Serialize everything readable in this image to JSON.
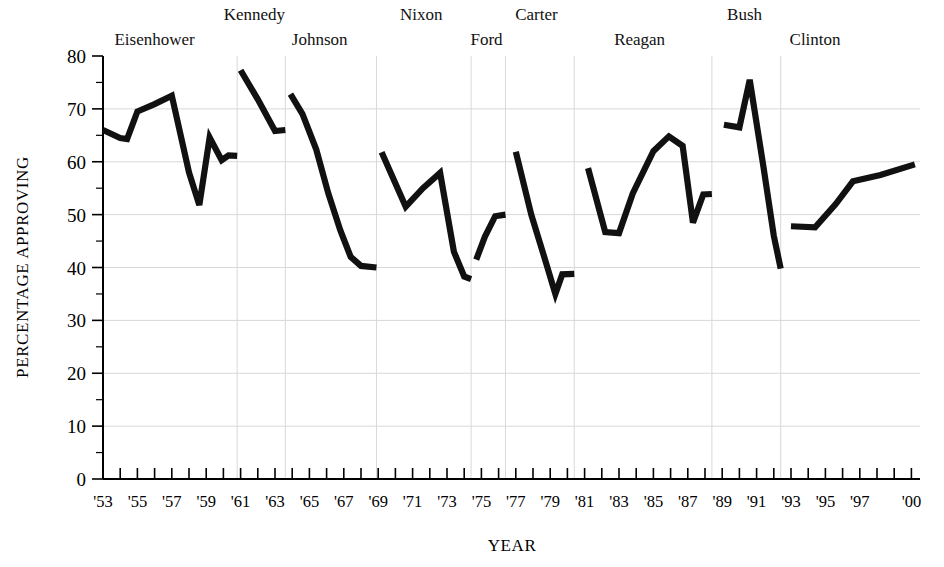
{
  "chart_data": {
    "type": "line",
    "title": "",
    "xlabel": "YEAR",
    "ylabel": "PERCENTAGE APPROVING",
    "ylim": [
      0,
      80
    ],
    "ytick_values": [
      0,
      10,
      20,
      30,
      40,
      50,
      60,
      70,
      80
    ],
    "ytick_labels": [
      "0",
      "10",
      "20",
      "30",
      "40",
      "50",
      "60",
      "70",
      "80"
    ],
    "y_minor_step": 5,
    "xlim": [
      1953,
      2000.5
    ],
    "xtick_labels": [
      "'53",
      "'55",
      "'57",
      "'59",
      "'61",
      "'63",
      "'65",
      "'67",
      "'69",
      "'71",
      "'73",
      "'75",
      "'77",
      "'79",
      "'81",
      "'83",
      "'85",
      "'87",
      "'89",
      "'91",
      "'93",
      "'95",
      "'97",
      "'00"
    ],
    "xtick_values": [
      1953,
      1955,
      1957,
      1959,
      1961,
      1963,
      1965,
      1967,
      1969,
      1971,
      1973,
      1975,
      1977,
      1979,
      1981,
      1983,
      1985,
      1987,
      1989,
      1991,
      1993,
      1995,
      1997,
      2000
    ],
    "x_minor_step": 1,
    "grid": "both",
    "legend_position": "none",
    "annotations": [
      {
        "label": "Eisenhower",
        "x": 1956.0,
        "row": 1
      },
      {
        "label": "Kennedy",
        "x": 1961.8,
        "row": 0
      },
      {
        "label": "Johnson",
        "x": 1965.6,
        "row": 1
      },
      {
        "label": "Nixon",
        "x": 1971.5,
        "row": 0
      },
      {
        "label": "Ford",
        "x": 1975.3,
        "row": 1
      },
      {
        "label": "Carter",
        "x": 1978.2,
        "row": 0
      },
      {
        "label": "Reagan",
        "x": 1984.2,
        "row": 1
      },
      {
        "label": "Bush",
        "x": 1990.3,
        "row": 0
      },
      {
        "label": "Clinton",
        "x": 1994.4,
        "row": 1
      }
    ],
    "term_boundaries": [
      1960.8,
      1963.6,
      1968.9,
      1974.4,
      1976.4,
      1980.4,
      1988.4,
      1992.4
    ],
    "series": [
      {
        "name": "Presidential approval",
        "segments": [
          {
            "president": "Eisenhower",
            "points": [
              [
                1953.0,
                66.0
              ],
              [
                1954.0,
                64.5
              ],
              [
                1954.4,
                64.3
              ],
              [
                1955.0,
                69.5
              ],
              [
                1956.0,
                70.9
              ],
              [
                1957.0,
                72.5
              ],
              [
                1958.0,
                58.0
              ],
              [
                1958.6,
                51.8
              ],
              [
                1959.2,
                64.6
              ],
              [
                1959.9,
                60.3
              ],
              [
                1960.3,
                61.2
              ],
              [
                1960.8,
                61.1
              ]
            ]
          },
          {
            "president": "Kennedy",
            "points": [
              [
                1961.0,
                77.3
              ],
              [
                1962.0,
                71.8
              ],
              [
                1963.0,
                65.8
              ],
              [
                1963.6,
                66.0
              ]
            ]
          },
          {
            "president": "Johnson",
            "points": [
              [
                1963.9,
                72.8
              ],
              [
                1964.6,
                69.0
              ],
              [
                1965.4,
                62.3
              ],
              [
                1966.1,
                54.0
              ],
              [
                1966.8,
                47.0
              ],
              [
                1967.4,
                42.0
              ],
              [
                1968.0,
                40.3
              ],
              [
                1968.9,
                40.0
              ]
            ]
          },
          {
            "president": "Nixon",
            "points": [
              [
                1969.2,
                61.8
              ],
              [
                1970.6,
                51.5
              ],
              [
                1971.6,
                55.0
              ],
              [
                1972.6,
                57.9
              ],
              [
                1973.4,
                43.0
              ],
              [
                1974.0,
                38.3
              ],
              [
                1974.4,
                37.8
              ]
            ]
          },
          {
            "president": "Ford",
            "points": [
              [
                1974.7,
                41.5
              ],
              [
                1975.2,
                45.8
              ],
              [
                1975.8,
                49.7
              ],
              [
                1976.4,
                50.0
              ]
            ]
          },
          {
            "president": "Carter",
            "points": [
              [
                1977.0,
                61.9
              ],
              [
                1977.9,
                50.0
              ],
              [
                1978.7,
                41.5
              ],
              [
                1979.3,
                35.0
              ],
              [
                1979.7,
                38.7
              ],
              [
                1980.4,
                38.8
              ]
            ]
          },
          {
            "president": "Reagan",
            "points": [
              [
                1981.2,
                58.8
              ],
              [
                1982.2,
                46.7
              ],
              [
                1983.0,
                46.5
              ],
              [
                1983.8,
                54.0
              ],
              [
                1985.0,
                62.0
              ],
              [
                1985.9,
                64.8
              ],
              [
                1986.7,
                63.0
              ],
              [
                1987.3,
                48.5
              ],
              [
                1987.9,
                53.8
              ],
              [
                1988.4,
                53.9
              ]
            ]
          },
          {
            "president": "Bush",
            "points": [
              [
                1989.1,
                67.0
              ],
              [
                1990.0,
                66.5
              ],
              [
                1990.6,
                75.5
              ],
              [
                1991.4,
                59.0
              ],
              [
                1992.0,
                46.0
              ],
              [
                1992.4,
                39.8
              ]
            ]
          },
          {
            "president": "Clinton",
            "points": [
              [
                1993.0,
                47.8
              ],
              [
                1994.4,
                47.6
              ],
              [
                1995.6,
                52.0
              ],
              [
                1996.6,
                56.3
              ],
              [
                1998.2,
                57.5
              ],
              [
                2000.2,
                59.5
              ]
            ]
          }
        ]
      }
    ]
  }
}
